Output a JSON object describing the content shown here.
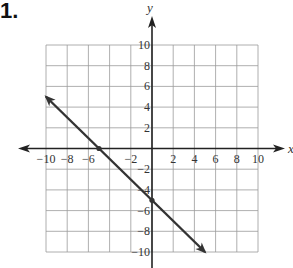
{
  "problem_number": "1.",
  "chart_data": {
    "type": "line",
    "title": "",
    "xlabel": "x",
    "ylabel": "y",
    "xlim": [
      -10,
      10
    ],
    "ylim": [
      -10,
      10
    ],
    "grid": true,
    "grid_step": 2,
    "x_ticks": [
      "-10",
      "-8",
      "-6",
      "-2",
      "2",
      "4",
      "6",
      "8",
      "10"
    ],
    "x_ticks_note": "-4 tick label obscured by line near point",
    "y_ticks": [
      "10",
      "8",
      "6",
      "4",
      "2",
      "-2",
      "-4",
      "-6",
      "-8",
      "-10"
    ],
    "series": [
      {
        "name": "line",
        "equation": "y = -x - 5",
        "x": [
          -10,
          5
        ],
        "y": [
          5,
          -10
        ],
        "arrows": "both ends",
        "marked_points": [
          [
            -5,
            0
          ],
          [
            0,
            -5
          ]
        ]
      }
    ],
    "legend": null
  }
}
